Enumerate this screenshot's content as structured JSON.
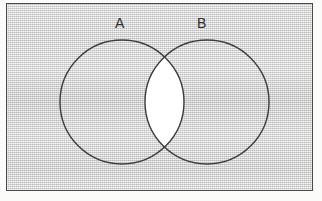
{
  "figure": {
    "kind": "venn-diagram",
    "set_count": 2,
    "background_color": "#d6d6d6",
    "stroke_color": "#3c3c3c",
    "frame_color": "#4a4a4a",
    "highlight_color": "#ffffff",
    "label_color": "#2b2b2b"
  },
  "labels": {
    "set_a": "A",
    "set_b": "B"
  },
  "geometry": {
    "frame": {
      "x": 6,
      "y": 3,
      "width": 307,
      "height": 188
    },
    "circle_a": {
      "cx": 115,
      "cy": 98,
      "r": 62
    },
    "circle_b": {
      "cx": 200,
      "cy": 98,
      "r": 62
    },
    "intersection_top": {
      "x": 157,
      "y": 46
    },
    "intersection_bottom": {
      "x": 157,
      "y": 150
    },
    "stroke_width": 1.4
  },
  "regions": {
    "a_only": {
      "name": "A only",
      "shaded": false,
      "fill": "#d6d6d6"
    },
    "b_only": {
      "name": "B only",
      "shaded": false,
      "fill": "#d6d6d6"
    },
    "intersection": {
      "name": "A intersect B",
      "shaded": true,
      "fill": "#ffffff"
    },
    "outside": {
      "name": "universe outside A and B",
      "shaded": false,
      "fill": "#d6d6d6"
    }
  }
}
